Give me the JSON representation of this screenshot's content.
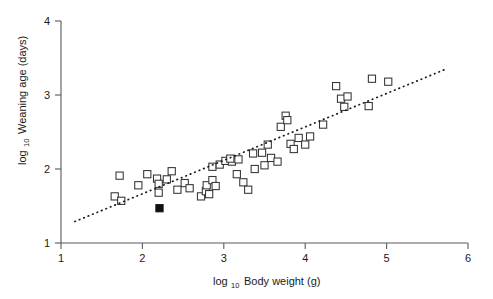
{
  "figure": {
    "background": "#ffffff",
    "marker_color": "#ffffff",
    "marker_edge_color": "#333333",
    "highlight_color": "#101010",
    "axis_color": "#5a5a5a",
    "line_color": "#1a1a1a"
  },
  "axes": {
    "x_label_main": "Body weight (g)",
    "x_label_prefix": "log",
    "x_label_subscript": "10",
    "y_label_main": "Weaning age (days)",
    "y_label_prefix": "log",
    "y_label_subscript": "10",
    "x_ticks": [
      "1",
      "2",
      "3",
      "4",
      "5",
      "6"
    ],
    "y_ticks": [
      "1",
      "2",
      "3",
      "4"
    ],
    "xlim": [
      1,
      6
    ],
    "ylim": [
      1,
      4
    ],
    "grid": false
  },
  "chart_data": {
    "type": "scatter",
    "title": "",
    "xlabel": "log10 Body weight (g)",
    "ylabel": "log10 Weaning age (days)",
    "xlim": [
      1,
      6
    ],
    "ylim": [
      1,
      4
    ],
    "grid": false,
    "legend": null,
    "series": [
      {
        "name": "species",
        "marker": "open-square",
        "points": [
          [
            1.72,
            1.91
          ],
          [
            1.66,
            1.63
          ],
          [
            1.74,
            1.57
          ],
          [
            1.95,
            1.78
          ],
          [
            2.06,
            1.93
          ],
          [
            2.18,
            1.87
          ],
          [
            2.2,
            1.8
          ],
          [
            2.3,
            1.86
          ],
          [
            2.36,
            1.97
          ],
          [
            2.2,
            1.68
          ],
          [
            2.43,
            1.72
          ],
          [
            2.52,
            1.81
          ],
          [
            2.58,
            1.74
          ],
          [
            2.72,
            1.63
          ],
          [
            2.78,
            1.7
          ],
          [
            2.82,
            1.66
          ],
          [
            2.79,
            1.78
          ],
          [
            2.86,
            1.85
          ],
          [
            2.9,
            1.77
          ],
          [
            2.86,
            2.03
          ],
          [
            2.95,
            2.06
          ],
          [
            3.02,
            2.11
          ],
          [
            3.1,
            2.1
          ],
          [
            3.08,
            2.14
          ],
          [
            3.18,
            2.13
          ],
          [
            3.16,
            1.93
          ],
          [
            3.24,
            1.82
          ],
          [
            3.3,
            1.72
          ],
          [
            3.38,
            2.0
          ],
          [
            3.36,
            2.21
          ],
          [
            3.47,
            2.22
          ],
          [
            3.5,
            2.05
          ],
          [
            3.54,
            2.33
          ],
          [
            3.58,
            2.15
          ],
          [
            3.66,
            2.1
          ],
          [
            3.7,
            2.57
          ],
          [
            3.76,
            2.72
          ],
          [
            3.78,
            2.66
          ],
          [
            3.82,
            2.34
          ],
          [
            3.86,
            2.27
          ],
          [
            3.92,
            2.42
          ],
          [
            4.0,
            2.33
          ],
          [
            4.06,
            2.44
          ],
          [
            4.22,
            2.6
          ],
          [
            4.38,
            3.12
          ],
          [
            4.44,
            2.95
          ],
          [
            4.48,
            2.84
          ],
          [
            4.52,
            2.98
          ],
          [
            4.78,
            2.85
          ],
          [
            4.82,
            3.22
          ],
          [
            5.02,
            3.18
          ]
        ]
      },
      {
        "name": "highlighted species",
        "marker": "filled-square",
        "points": [
          [
            2.21,
            1.47
          ]
        ]
      }
    ],
    "trend_line": {
      "style": "dotted",
      "x_start": 1.17,
      "y_start": 1.29,
      "x_end": 5.75,
      "y_end": 3.36
    }
  }
}
